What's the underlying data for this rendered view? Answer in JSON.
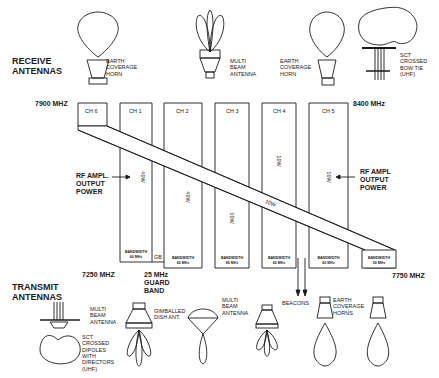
{
  "diagram": {
    "sections": {
      "receive": "RECEIVE\nANTENNAS",
      "transmit": "TRANSMIT\nANTENNAS"
    },
    "frequencies": {
      "receive_low": "7900 MHZ",
      "receive_high": "8400 MHz",
      "transmit_low": "7250 MHZ",
      "transmit_high": "7750 MHZ",
      "guard_band": "25 MHz\nGUARD\nBAND",
      "gb_short": "GB"
    },
    "channels": [
      {
        "label": "CH 6",
        "bandwidth": "BANDWIDTH\n50 MHz",
        "power": "10W"
      },
      {
        "label": "CH 1",
        "bandwidth": "BANDWIDTH\n60 MHz",
        "power": "40W"
      },
      {
        "label": "CH 2",
        "bandwidth": "BANDWIDTH\n60 MHz",
        "power": "40W"
      },
      {
        "label": "CH 3",
        "bandwidth": "BANDWIDTH\n85 MHz",
        "power": "10W"
      },
      {
        "label": "CH 4",
        "bandwidth": "BANDWIDTH\n60 MHz",
        "power": "10W"
      },
      {
        "label": "CH 5",
        "bandwidth": "BANDWIDTH\n60 MHz",
        "power": "10W"
      }
    ],
    "extra_power": {
      "ch3_upper": "10W"
    },
    "rf_ampl_left": "RF AMPL.\nOUTPUT\nPOWER",
    "rf_ampl_right": "RF AMPL\nOUTPUT\nPOWER",
    "beacons": "BEACONS",
    "receive_antennas": [
      {
        "name": "EARTH\nCOVERAGE\nHORN"
      },
      {
        "name": "MULTI\nBEAM\nANTENNA"
      },
      {
        "name": "EARTH\nCOVERAGE\nHORN"
      },
      {
        "name": "SCT\nCROSSED\nBOW TIE\n(UHF)"
      }
    ],
    "transmit_antennas": [
      {
        "name": "MULTI\nBEAM\nANTENNA"
      },
      {
        "name": "SCT\nCROSSED\nDIPOLES\nWITH\nDIRECTORS\n(UHF)"
      },
      {
        "name": "GIMBALLED\nDISH ANT."
      },
      {
        "name": "MULTI\nBEAM\nANTENNA"
      },
      {
        "name": "EARTH\nCOVERAGE\nHORNS"
      }
    ]
  }
}
